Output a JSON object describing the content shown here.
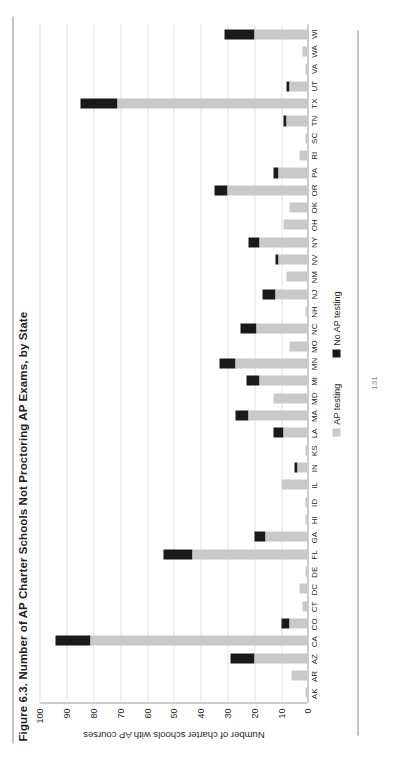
{
  "figure": {
    "title": "Figure 6.3. Number of AP Charter Schools Not Proctoring AP Exams, by State",
    "page_number": "131"
  },
  "legend": {
    "position": "bottom-center",
    "items": [
      {
        "label": "AP testing",
        "color": "#c9c9c9"
      },
      {
        "label": "No AP testing",
        "color": "#1a1a1a"
      }
    ]
  },
  "axis": {
    "ylabel": "Number of charter schools with AP courses",
    "yticks": [
      "100",
      "90",
      "80",
      "70",
      "60",
      "50",
      "40",
      "30",
      "20",
      "10",
      "0"
    ],
    "ymin": 0,
    "ymax": 100,
    "ystep": 10
  },
  "chart_data": {
    "type": "bar",
    "stacked": true,
    "orientation": "vertical",
    "title": "Figure 6.3. Number of AP Charter Schools Not Proctoring AP Exams, by State",
    "xlabel": "",
    "ylabel": "Number of charter schools with AP courses",
    "ylim": [
      0,
      100
    ],
    "ystep": 10,
    "grid": true,
    "legend_position": "bottom-center",
    "categories": [
      "AK",
      "AR",
      "AZ",
      "CA",
      "CO",
      "CT",
      "DC",
      "DE",
      "FL",
      "GA",
      "HI",
      "ID",
      "IL",
      "IN",
      "KS",
      "LA",
      "MA",
      "MD",
      "MI",
      "MN",
      "MO",
      "NC",
      "NH",
      "NJ",
      "NM",
      "NV",
      "NY",
      "OH",
      "OK",
      "OR",
      "PA",
      "RI",
      "SC",
      "TN",
      "TX",
      "UT",
      "VA",
      "WA",
      "WI"
    ],
    "series": [
      {
        "name": "AP testing",
        "color": "#c9c9c9",
        "values": [
          1,
          6,
          20,
          81,
          7,
          2,
          3,
          1,
          43,
          16,
          1,
          1,
          10,
          4,
          1,
          9,
          22,
          13,
          18,
          27,
          7,
          19,
          1,
          12,
          8,
          11,
          18,
          9,
          7,
          30,
          11,
          3,
          1,
          8,
          71,
          7,
          1,
          2,
          20
        ]
      },
      {
        "name": "No AP testing",
        "color": "#1a1a1a",
        "values": [
          0,
          0,
          9,
          13,
          3,
          0,
          0,
          0,
          11,
          4,
          0,
          0,
          0,
          1,
          0,
          4,
          5,
          0,
          5,
          6,
          0,
          6,
          0,
          5,
          0,
          1,
          4,
          0,
          0,
          5,
          2,
          0,
          0,
          1,
          14,
          1,
          0,
          0,
          11
        ]
      }
    ],
    "totals": [
      1,
      6,
      29,
      94,
      10,
      2,
      3,
      1,
      54,
      20,
      1,
      1,
      10,
      5,
      1,
      13,
      27,
      13,
      23,
      33,
      7,
      25,
      1,
      17,
      8,
      12,
      22,
      9,
      7,
      35,
      13,
      3,
      1,
      9,
      85,
      8,
      1,
      2,
      31
    ]
  }
}
